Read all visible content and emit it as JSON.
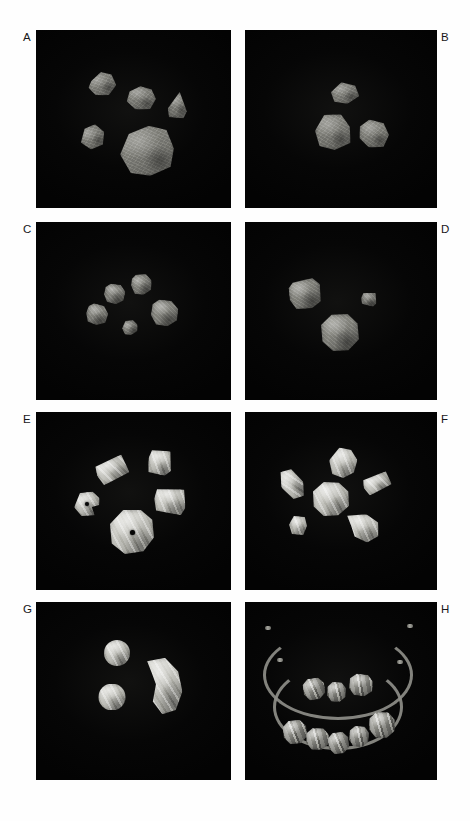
{
  "figure": {
    "page_background": "#fefefe",
    "panel_background": "#050505",
    "label_color": "#17171a",
    "columns": 2,
    "rows": 4,
    "panel_count": 8,
    "labels": [
      "A",
      "B",
      "C",
      "D",
      "E",
      "F",
      "G",
      "H"
    ]
  },
  "panels": [
    {
      "id": "panel-a",
      "label": "A",
      "label_side": "left",
      "x": 36,
      "y": 30,
      "w": 195,
      "h": 178,
      "description": "Five irregular grey rough lithic fragments on black background",
      "object_count": 5,
      "object_class": "lithic",
      "objects": [
        {
          "name": "fragment-1",
          "x": 52,
          "y": 42,
          "w": 28,
          "h": 24,
          "rot": -8,
          "shape": "polygon(14% 32%, 52% 0%, 88% 16%, 100% 62%, 68% 100%, 22% 92%, 0% 58%)"
        },
        {
          "name": "fragment-2",
          "x": 90,
          "y": 56,
          "w": 30,
          "h": 24,
          "rot": 6,
          "shape": "polygon(10% 28%, 44% 2%, 82% 10%, 100% 48%, 84% 92%, 36% 100%, 4% 70%)"
        },
        {
          "name": "fragment-3",
          "x": 132,
          "y": 62,
          "w": 20,
          "h": 26,
          "rot": 4,
          "shape": "polygon(54% 0%, 96% 72%, 82% 100%, 10% 100%, 0% 66%)"
        },
        {
          "name": "fragment-4",
          "x": 44,
          "y": 95,
          "w": 25,
          "h": 24,
          "rot": -12,
          "shape": "polygon(26% 10%, 70% 0%, 100% 40%, 84% 90%, 34% 100%, 0% 62%)"
        },
        {
          "name": "fragment-5",
          "x": 84,
          "y": 96,
          "w": 54,
          "h": 50,
          "rot": -3,
          "shape": "polygon(18% 14%, 56% 0%, 88% 10%, 100% 48%, 92% 84%, 54% 100%, 18% 92%, 0% 54%)"
        }
      ]
    },
    {
      "id": "panel-b",
      "label": "B",
      "label_side": "right",
      "x": 245,
      "y": 30,
      "w": 192,
      "h": 178,
      "description": "Three irregular grey lithic fragments on black background",
      "object_count": 3,
      "object_class": "lithic",
      "objects": [
        {
          "name": "fragment-1",
          "x": 86,
          "y": 52,
          "w": 28,
          "h": 22,
          "rot": -4,
          "shape": "polygon(40% 0%, 88% 20%, 100% 68%, 56% 100%, 10% 86%, 0% 42%)"
        },
        {
          "name": "fragment-2",
          "x": 70,
          "y": 84,
          "w": 36,
          "h": 36,
          "rot": 2,
          "shape": "polygon(24% 4%, 70% 0%, 96% 34%, 100% 78%, 56% 100%, 14% 90%, 0% 48%)"
        },
        {
          "name": "fragment-3",
          "x": 114,
          "y": 90,
          "w": 30,
          "h": 28,
          "rot": 6,
          "shape": "polygon(30% 0%, 78% 8%, 100% 48%, 86% 92%, 38% 100%, 4% 70%, 0% 30%)"
        }
      ]
    },
    {
      "id": "panel-c",
      "label": "C",
      "label_side": "left",
      "x": 36,
      "y": 222,
      "w": 195,
      "h": 178,
      "description": "Five small rounded polygonal stone beads arranged in a loose ring",
      "object_count": 5,
      "object_class": "stonebead",
      "objects": [
        {
          "name": "bead-1",
          "x": 68,
          "y": 62,
          "w": 21,
          "h": 20,
          "rot": 8,
          "shape": "polygon(26% 2%, 72% 0%, 100% 32%, 96% 76%, 62% 100%, 20% 94%, 0% 58%, 4% 22%)"
        },
        {
          "name": "bead-2",
          "x": 95,
          "y": 52,
          "w": 21,
          "h": 21,
          "rot": -6,
          "shape": "polygon(30% 0%, 76% 4%, 100% 36%, 92% 80%, 54% 100%, 14% 90%, 0% 50%, 8% 18%)"
        },
        {
          "name": "bead-3",
          "x": 50,
          "y": 82,
          "w": 22,
          "h": 21,
          "rot": 12,
          "shape": "polygon(28% 0%, 74% 4%, 100% 38%, 94% 80%, 56% 100%, 16% 92%, 0% 52%, 6% 18%)"
        },
        {
          "name": "bead-4",
          "x": 86,
          "y": 98,
          "w": 16,
          "h": 15,
          "rot": -10,
          "shape": "polygon(30% 0%, 76% 6%, 100% 40%, 90% 82%, 50% 100%, 12% 88%, 0% 48%)"
        },
        {
          "name": "bead-5",
          "x": 115,
          "y": 78,
          "w": 27,
          "h": 26,
          "rot": 4,
          "shape": "polygon(28% 0%, 72% 2%, 100% 32%, 98% 74%, 64% 100%, 22% 96%, 0% 60%, 4% 20%)"
        }
      ]
    },
    {
      "id": "panel-d",
      "label": "D",
      "label_side": "right",
      "x": 245,
      "y": 222,
      "w": 192,
      "h": 178,
      "description": "Three stone beads: a rounded cube, a small square bead, and a large spheroid bead",
      "object_count": 3,
      "object_class": "stonebead",
      "objects": [
        {
          "name": "bead-cuboid",
          "x": 44,
          "y": 57,
          "w": 32,
          "h": 30,
          "rot": -7,
          "shape": "polygon(16% 8%, 78% 0%, 100% 24%, 96% 80%, 66% 100%, 18% 96%, 0% 62%, 2% 24%)"
        },
        {
          "name": "bead-square-small",
          "x": 116,
          "y": 70,
          "w": 16,
          "h": 14,
          "rot": 10,
          "shape": "polygon(10% 14%, 84% 0%, 100% 72%, 82% 100%, 12% 92%, 0% 50%)"
        },
        {
          "name": "bead-spheroid",
          "x": 76,
          "y": 92,
          "w": 38,
          "h": 37,
          "rot": 0,
          "shape": "polygon(28% 2%, 70% 0%, 96% 26%, 100% 68%, 72% 98%, 32% 100%, 4% 74%, 0% 30%)"
        }
      ]
    },
    {
      "id": "panel-e",
      "label": "E",
      "label_side": "left",
      "x": 36,
      "y": 412,
      "w": 195,
      "h": 178,
      "description": "Five polished banded beads including two perforated disc beads and three barrel/rectangular beads",
      "object_count": 5,
      "object_class": "polished",
      "objects": [
        {
          "name": "bead-rect-1",
          "x": 60,
          "y": 46,
          "w": 32,
          "h": 24,
          "rot": -18,
          "shape": "polygon(4% 16%, 92% 0%, 100% 80%, 12% 100%, 0% 54%)",
          "perforated": false
        },
        {
          "name": "bead-square-2",
          "x": 112,
          "y": 38,
          "w": 24,
          "h": 25,
          "rot": 8,
          "shape": "polygon(10% 6%, 86% 0%, 100% 78%, 76% 100%, 8% 94%, 0% 40%)",
          "perforated": false
        },
        {
          "name": "bead-disc-small",
          "x": 38,
          "y": 80,
          "w": 26,
          "h": 24,
          "rot": -4,
          "shape": "polygon(26% 2%, 74% 0%, 100% 30%, 96% 58%, 68% 64%, 76% 100%, 26% 98%, 0% 60%)",
          "perforated": true,
          "hole": {
            "x": 11,
            "y": 10,
            "d": 4
          }
        },
        {
          "name": "bead-rect-3",
          "x": 118,
          "y": 76,
          "w": 32,
          "h": 26,
          "rot": 6,
          "shape": "polygon(6% 10%, 90% 0%, 100% 70%, 88% 100%, 10% 92%, 0% 46%)",
          "perforated": false
        },
        {
          "name": "bead-disc-large",
          "x": 74,
          "y": 98,
          "w": 44,
          "h": 44,
          "rot": 0,
          "shape": "polygon(30% 0%, 70% 0%, 96% 22%, 100% 62%, 76% 94%, 34% 100%, 4% 76%, 0% 32%)",
          "perforated": true,
          "hole": {
            "x": 20,
            "y": 20,
            "d": 5
          }
        }
      ]
    },
    {
      "id": "panel-f",
      "label": "F",
      "label_side": "right",
      "x": 245,
      "y": 412,
      "w": 192,
      "h": 178,
      "description": "Six translucent whitish banded beads of varied shapes including a lunate bead",
      "object_count": 6,
      "object_class": "polished",
      "objects": [
        {
          "name": "bead-tube-left",
          "x": 36,
          "y": 56,
          "w": 22,
          "h": 32,
          "rot": -28,
          "shape": "polygon(30% 0%, 78% 8%, 100% 60%, 72% 100%, 24% 94%, 0% 44%)"
        },
        {
          "name": "bead-ovoid-top",
          "x": 84,
          "y": 36,
          "w": 28,
          "h": 30,
          "rot": 6,
          "shape": "polygon(32% 0%, 74% 4%, 100% 36%, 92% 78%, 56% 100%, 16% 90%, 0% 46%)"
        },
        {
          "name": "bead-barrel-right",
          "x": 118,
          "y": 62,
          "w": 28,
          "h": 19,
          "rot": -16,
          "shape": "polygon(6% 14%, 92% 0%, 100% 74%, 14% 100%, 0% 52%)"
        },
        {
          "name": "bead-round-center",
          "x": 68,
          "y": 70,
          "w": 36,
          "h": 34,
          "rot": 0,
          "shape": "polygon(30% 0%, 72% 2%, 98% 28%, 100% 70%, 70% 98%, 30% 100%, 2% 72%, 0% 28%)"
        },
        {
          "name": "bead-small-low",
          "x": 44,
          "y": 104,
          "w": 18,
          "h": 19,
          "rot": 8,
          "shape": "polygon(20% 4%, 80% 0%, 100% 46%, 86% 96%, 24% 100%, 0% 52%)"
        },
        {
          "name": "bead-lunate",
          "x": 100,
          "y": 102,
          "w": 34,
          "h": 28,
          "rot": 4,
          "shape": "polygon(4% 10%, 60% 0%, 96% 26%, 100% 74%, 68% 100%, 30% 82%, 18% 46%)"
        }
      ]
    },
    {
      "id": "panel-g",
      "label": "G",
      "label_side": "left",
      "x": 36,
      "y": 602,
      "w": 195,
      "h": 178,
      "description": "Two spherical polished beads and one large crescent lunate bead",
      "object_count": 3,
      "object_class": "polished",
      "objects": [
        {
          "name": "bead-sphere-upper",
          "x": 68,
          "y": 38,
          "w": 26,
          "h": 26,
          "rot": 0,
          "shape": "circle(50% at 50% 50%)"
        },
        {
          "name": "bead-sphere-lower",
          "x": 62,
          "y": 82,
          "w": 28,
          "h": 26,
          "rot": 0,
          "shape": "circle(50% at 50% 50%)"
        },
        {
          "name": "bead-lunate-large",
          "x": 110,
          "y": 56,
          "w": 36,
          "h": 56,
          "rot": -4,
          "shape": "polygon(8% 4%, 58% 0%, 92% 26%, 100% 62%, 78% 94%, 40% 100%, 16% 76%, 28% 46%, 18% 24%)"
        }
      ]
    },
    {
      "id": "panel-h",
      "label": "H",
      "label_side": "right",
      "x": 245,
      "y": 602,
      "w": 192,
      "h": 178,
      "description": "Two strung necklaces on cords: upper strand with three banded beads, lower strand with five banded beads",
      "object_count": 8,
      "object_class": "banded",
      "strands": [
        {
          "name": "necklace-upper",
          "bead_count": 3
        },
        {
          "name": "necklace-lower",
          "bead_count": 5
        }
      ],
      "objects": [
        {
          "name": "upper-bead-1",
          "x": 58,
          "y": 76,
          "w": 22,
          "h": 22,
          "rot": -6,
          "shape": "polygon(26% 2%, 72% 0%, 98% 28%, 100% 70%, 70% 98%, 28% 100%, 2% 70%, 0% 28%)"
        },
        {
          "name": "upper-bead-2",
          "x": 82,
          "y": 80,
          "w": 19,
          "h": 20,
          "rot": 4,
          "shape": "polygon(26% 2%, 72% 0%, 98% 28%, 100% 70%, 70% 98%, 28% 100%, 2% 70%, 0% 28%)"
        },
        {
          "name": "upper-bead-3",
          "x": 104,
          "y": 72,
          "w": 24,
          "h": 22,
          "rot": 8,
          "shape": "polygon(26% 2%, 72% 0%, 98% 28%, 100% 70%, 70% 98%, 28% 100%, 2% 70%, 0% 28%)"
        },
        {
          "name": "lower-bead-1",
          "x": 38,
          "y": 118,
          "w": 24,
          "h": 24,
          "rot": -4,
          "shape": "polygon(26% 2%, 72% 0%, 98% 28%, 100% 70%, 70% 98%, 28% 100%, 2% 70%, 0% 28%)"
        },
        {
          "name": "lower-bead-2",
          "x": 61,
          "y": 126,
          "w": 23,
          "h": 22,
          "rot": 3,
          "shape": "polygon(26% 2%, 72% 0%, 98% 28%, 100% 70%, 70% 98%, 28% 100%, 2% 70%, 0% 28%)"
        },
        {
          "name": "lower-bead-3",
          "x": 83,
          "y": 130,
          "w": 21,
          "h": 22,
          "rot": -5,
          "shape": "polygon(26% 2%, 72% 0%, 98% 28%, 100% 70%, 70% 98%, 28% 100%, 2% 70%, 0% 28%)"
        },
        {
          "name": "lower-bead-4",
          "x": 104,
          "y": 124,
          "w": 20,
          "h": 21,
          "rot": 6,
          "shape": "polygon(26% 2%, 72% 0%, 98% 28%, 100% 70%, 70% 98%, 28% 100%, 2% 70%, 0% 28%)"
        },
        {
          "name": "lower-bead-5",
          "x": 124,
          "y": 110,
          "w": 26,
          "h": 26,
          "rot": 2,
          "shape": "polygon(26% 2%, 72% 0%, 98% 28%, 100% 70%, 70% 98%, 28% 100%, 2% 70%, 0% 28%)"
        }
      ]
    }
  ]
}
